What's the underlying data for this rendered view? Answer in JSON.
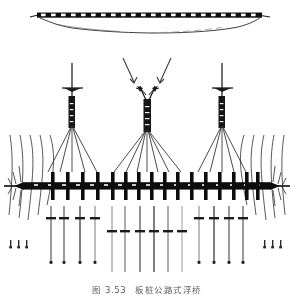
{
  "figure": {
    "domain": "engineering-drawing",
    "caption_number": "图 3.53",
    "caption_title": "板桩公路式浮桥",
    "caption_full": "图 3.53    板桩公路式浮桥",
    "background_color": "#ffffff",
    "ink_color": "#1a1a1a",
    "light_ink_color": "#6b6b6b"
  },
  "views": {
    "elevation": {
      "name": "elevation-section-view",
      "label": "",
      "deck_top_y": 14,
      "deck_left_x": 36,
      "deck_right_x": 262,
      "riverbed_depth": 18,
      "panel_count": 22
    },
    "plan": {
      "name": "plan-view",
      "deck_center_y": 186,
      "deck_left_x": 8,
      "deck_right_x": 286
    }
  },
  "pylons": [
    {
      "id": "pylon-left",
      "x": 72,
      "top_y": 63,
      "base_y": 128,
      "type": "single-mast",
      "cable_count": 5
    },
    {
      "id": "pylon-center",
      "x": 147,
      "top_y": 86,
      "base_y": 132,
      "type": "a-frame",
      "cable_count": 7
    },
    {
      "id": "pylon-right",
      "x": 222,
      "top_y": 63,
      "base_y": 128,
      "type": "single-mast",
      "cable_count": 5
    }
  ],
  "annotations": [
    {
      "id": "leader-left",
      "x1": 122,
      "y1": 57,
      "x2": 133,
      "y2": 83,
      "arrow": "down-left"
    },
    {
      "id": "leader-right",
      "x1": 172,
      "y1": 57,
      "x2": 161,
      "y2": 83,
      "arrow": "down-right"
    }
  ],
  "deck_crossbeams_upper": {
    "count": 16,
    "x_positions": [
      53,
      68,
      83,
      98,
      113,
      126,
      139,
      152,
      165,
      178,
      192,
      206,
      220,
      234,
      247,
      258
    ],
    "top_y": 168,
    "bottom_y": 204
  },
  "anchor_piles_left": {
    "count": 4,
    "x_positions": [
      51,
      64,
      80,
      95
    ],
    "top_y": 206,
    "bottom_y": 263,
    "node_y": 218
  },
  "anchor_piles_center": {
    "count": 6,
    "x_positions": [
      112,
      125,
      140,
      154,
      168,
      182
    ],
    "top_y": 206,
    "bottom_y": 272,
    "node_y": 231
  },
  "anchor_piles_right": {
    "count": 4,
    "x_positions": [
      199,
      214,
      229,
      243
    ],
    "top_y": 206,
    "bottom_y": 263,
    "node_y": 218
  },
  "flow_lines": {
    "left_count": 5,
    "right_count": 5,
    "description": "current-streamlines"
  },
  "abutments": [
    {
      "id": "abutment-left",
      "x": 22,
      "y": 186
    },
    {
      "id": "abutment-right",
      "x": 272,
      "y": 186
    }
  ]
}
